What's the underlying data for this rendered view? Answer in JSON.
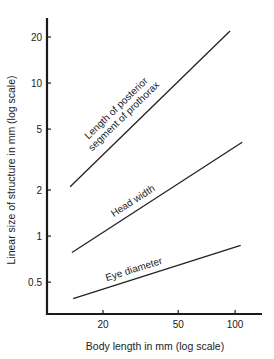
{
  "chart_data": {
    "type": "line",
    "title": "",
    "xlabel": "Body length in mm (log scale)",
    "ylabel": "Linear size of structure in mm (log scale)",
    "x_scale": "log",
    "y_scale": "log",
    "x_ticks": [
      20,
      50,
      100
    ],
    "x_tick_labels": [
      "20",
      "50",
      "100"
    ],
    "y_ticks": [
      0.5,
      1,
      2,
      5,
      10,
      20
    ],
    "y_tick_labels": [
      "0.5",
      "1",
      "2",
      "5",
      "10",
      "20"
    ],
    "xlim": [
      10,
      130
    ],
    "ylim": [
      0.27,
      26
    ],
    "grid": false,
    "legend": "none (inline labels on lines)",
    "series": [
      {
        "name": "Length of posterior segment of prothorax",
        "label_lines": [
          "Length of posterior",
          "segment of prothorax"
        ],
        "x": [
          13.4,
          94
        ],
        "y": [
          2.1,
          21.9
        ]
      },
      {
        "name": "Head width",
        "label_lines": [
          "Head width"
        ],
        "x": [
          13.7,
          109
        ],
        "y": [
          0.78,
          4.1
        ]
      },
      {
        "name": "Eye diameter",
        "label_lines": [
          "Eye diameter"
        ],
        "x": [
          13.9,
          107
        ],
        "y": [
          0.39,
          0.87
        ]
      }
    ]
  }
}
